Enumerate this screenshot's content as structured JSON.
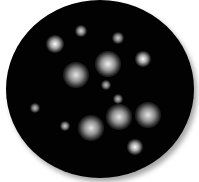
{
  "scene": {
    "description": "Black circular field with scattered glowing white spots",
    "background_color": "#ffffff",
    "disc_color": "#020202",
    "spot_color": "#ffffff",
    "spot_count": 16
  }
}
